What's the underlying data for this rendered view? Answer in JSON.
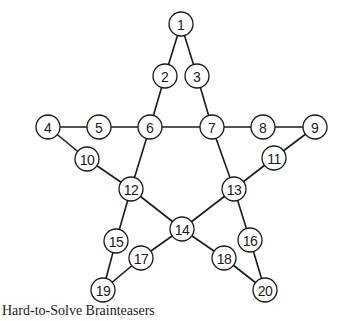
{
  "diagram": {
    "type": "star-graph-puzzle",
    "node_radius": 12,
    "nodes": [
      {
        "id": "1",
        "label": "1",
        "x": 181,
        "y": 24
      },
      {
        "id": "2",
        "label": "2",
        "x": 165,
        "y": 76
      },
      {
        "id": "3",
        "label": "3",
        "x": 197,
        "y": 76
      },
      {
        "id": "4",
        "label": "4",
        "x": 48,
        "y": 127
      },
      {
        "id": "5",
        "label": "5",
        "x": 99,
        "y": 127
      },
      {
        "id": "6",
        "label": "6",
        "x": 150,
        "y": 127
      },
      {
        "id": "7",
        "label": "7",
        "x": 212,
        "y": 127
      },
      {
        "id": "8",
        "label": "8",
        "x": 263,
        "y": 127
      },
      {
        "id": "9",
        "label": "9",
        "x": 315,
        "y": 127
      },
      {
        "id": "10",
        "label": "10",
        "x": 87,
        "y": 159
      },
      {
        "id": "11",
        "label": "11",
        "x": 274,
        "y": 158
      },
      {
        "id": "12",
        "label": "12",
        "x": 131,
        "y": 189
      },
      {
        "id": "13",
        "label": "13",
        "x": 234,
        "y": 189
      },
      {
        "id": "14",
        "label": "14",
        "x": 182,
        "y": 229
      },
      {
        "id": "15",
        "label": "15",
        "x": 116,
        "y": 241
      },
      {
        "id": "16",
        "label": "16",
        "x": 250,
        "y": 240
      },
      {
        "id": "17",
        "label": "17",
        "x": 141,
        "y": 258
      },
      {
        "id": "18",
        "label": "18",
        "x": 224,
        "y": 258
      },
      {
        "id": "19",
        "label": "19",
        "x": 103,
        "y": 290
      },
      {
        "id": "20",
        "label": "20",
        "x": 265,
        "y": 290
      }
    ],
    "edges": [
      [
        "1",
        "2"
      ],
      [
        "1",
        "3"
      ],
      [
        "2",
        "6"
      ],
      [
        "3",
        "7"
      ],
      [
        "4",
        "5"
      ],
      [
        "5",
        "6"
      ],
      [
        "6",
        "7"
      ],
      [
        "7",
        "8"
      ],
      [
        "8",
        "9"
      ],
      [
        "4",
        "10"
      ],
      [
        "10",
        "12"
      ],
      [
        "9",
        "11"
      ],
      [
        "11",
        "13"
      ],
      [
        "6",
        "12"
      ],
      [
        "7",
        "13"
      ],
      [
        "12",
        "14"
      ],
      [
        "13",
        "14"
      ],
      [
        "12",
        "15"
      ],
      [
        "15",
        "19"
      ],
      [
        "13",
        "16"
      ],
      [
        "16",
        "20"
      ],
      [
        "14",
        "17"
      ],
      [
        "17",
        "19"
      ],
      [
        "14",
        "18"
      ],
      [
        "18",
        "20"
      ]
    ]
  },
  "footer": {
    "caption": "Hard-to-Solve Brainteasers"
  }
}
